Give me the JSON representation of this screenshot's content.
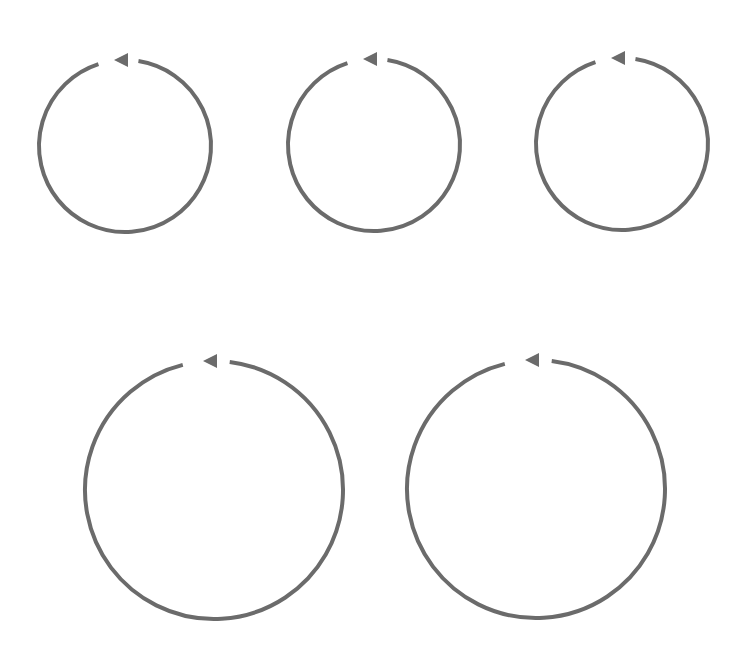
{
  "diagram": {
    "title": "",
    "stroke_color": "#6b6b6b",
    "background": "#ffffff",
    "stroke_width": 4,
    "cycles": [
      {
        "id": "cycle-1",
        "cx": 125,
        "cy": 146,
        "r": 86,
        "direction": "counterclockwise",
        "label": ""
      },
      {
        "id": "cycle-2",
        "cx": 374,
        "cy": 145,
        "r": 86,
        "direction": "counterclockwise",
        "label": ""
      },
      {
        "id": "cycle-3",
        "cx": 622,
        "cy": 144,
        "r": 86,
        "direction": "counterclockwise",
        "label": ""
      },
      {
        "id": "cycle-4",
        "cx": 214,
        "cy": 490,
        "r": 129,
        "direction": "counterclockwise",
        "label": ""
      },
      {
        "id": "cycle-5",
        "cx": 536,
        "cy": 489,
        "r": 129,
        "direction": "counterclockwise",
        "label": ""
      }
    ]
  }
}
